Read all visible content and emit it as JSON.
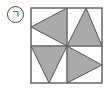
{
  "label": {
    "text": "ㄱ",
    "style": "circled"
  },
  "figure": {
    "outer_square": {
      "x": 31,
      "y": 8,
      "width": 71,
      "height": 75
    },
    "center": {
      "x": 67,
      "y": 46
    },
    "colors": {
      "fill": "#a9a9a9",
      "stroke": "#555555",
      "border": "#666666",
      "background": "#ffffff"
    },
    "triangles": [
      {
        "quadrant": "top-left",
        "points": "67,8 31,27 67,46",
        "direction": "left"
      },
      {
        "quadrant": "top-right",
        "points": "86,8 67,46 102,46",
        "direction": "up"
      },
      {
        "quadrant": "bottom-left",
        "points": "31,46 67,46 49,83",
        "direction": "down"
      },
      {
        "quadrant": "bottom-right",
        "points": "67,46 102,65 67,83",
        "direction": "right"
      }
    ]
  }
}
